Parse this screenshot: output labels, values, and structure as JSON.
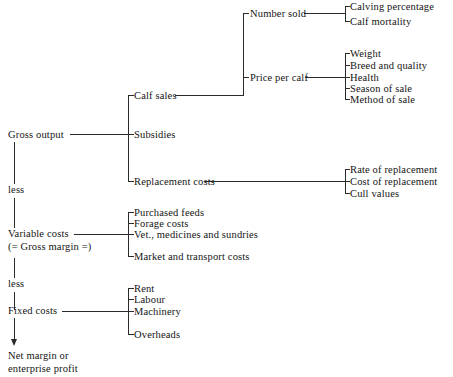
{
  "diagram": {
    "type": "tree-bracket-diagram",
    "orientation": "left-to-right",
    "line_color": "#2a2a2a",
    "text_color": "#141414",
    "background": "#ffffff"
  },
  "spine": {
    "items": [
      {
        "id": "gross-output",
        "label": "Gross output"
      },
      {
        "id": "less-1",
        "label": "less"
      },
      {
        "id": "variable-costs",
        "label": "Variable costs"
      },
      {
        "id": "gross-margin",
        "label": "(= Gross margin =)"
      },
      {
        "id": "less-2",
        "label": "less"
      },
      {
        "id": "fixed-costs",
        "label": "Fixed costs"
      },
      {
        "id": "net-margin",
        "label": "Net margin or\nenterprise profit"
      }
    ]
  },
  "branches": {
    "gross_output": {
      "children": [
        {
          "id": "calf-sales",
          "label": "Calf sales"
        },
        {
          "id": "subsidies",
          "label": "Subsidies"
        },
        {
          "id": "replacement-costs",
          "label": "Replacement costs"
        }
      ]
    },
    "calf_sales": {
      "children": [
        {
          "id": "number-sold",
          "label": "Number sold"
        },
        {
          "id": "price-per-calf",
          "label": "Price per calf"
        }
      ]
    },
    "number_sold": {
      "children": [
        {
          "id": "calving-percentage",
          "label": "Calving percentage"
        },
        {
          "id": "calf-mortality",
          "label": "Calf mortality"
        }
      ]
    },
    "price_per_calf": {
      "children": [
        {
          "id": "weight",
          "label": "Weight"
        },
        {
          "id": "breed-and-quality",
          "label": "Breed and quality"
        },
        {
          "id": "health",
          "label": "Health"
        },
        {
          "id": "season-of-sale",
          "label": "Season of sale"
        },
        {
          "id": "method-of-sale",
          "label": "Method of sale"
        }
      ]
    },
    "replacement_costs": {
      "children": [
        {
          "id": "rate-of-replacement",
          "label": "Rate of replacement"
        },
        {
          "id": "cost-of-replacement",
          "label": "Cost of replacement"
        },
        {
          "id": "cull-values",
          "label": "Cull values"
        }
      ]
    },
    "variable_costs": {
      "children": [
        {
          "id": "purchased-feeds",
          "label": "Purchased feeds"
        },
        {
          "id": "forage-costs",
          "label": "Forage costs"
        },
        {
          "id": "vet-medicines-sundries",
          "label": "Vet., medicines and sundries"
        },
        {
          "id": "market-transport-costs",
          "label": "Market and transport costs"
        }
      ]
    },
    "fixed_costs": {
      "children": [
        {
          "id": "rent",
          "label": "Rent"
        },
        {
          "id": "labour",
          "label": "Labour"
        },
        {
          "id": "machinery",
          "label": "Machinery"
        },
        {
          "id": "overheads",
          "label": "Overheads"
        }
      ]
    }
  }
}
